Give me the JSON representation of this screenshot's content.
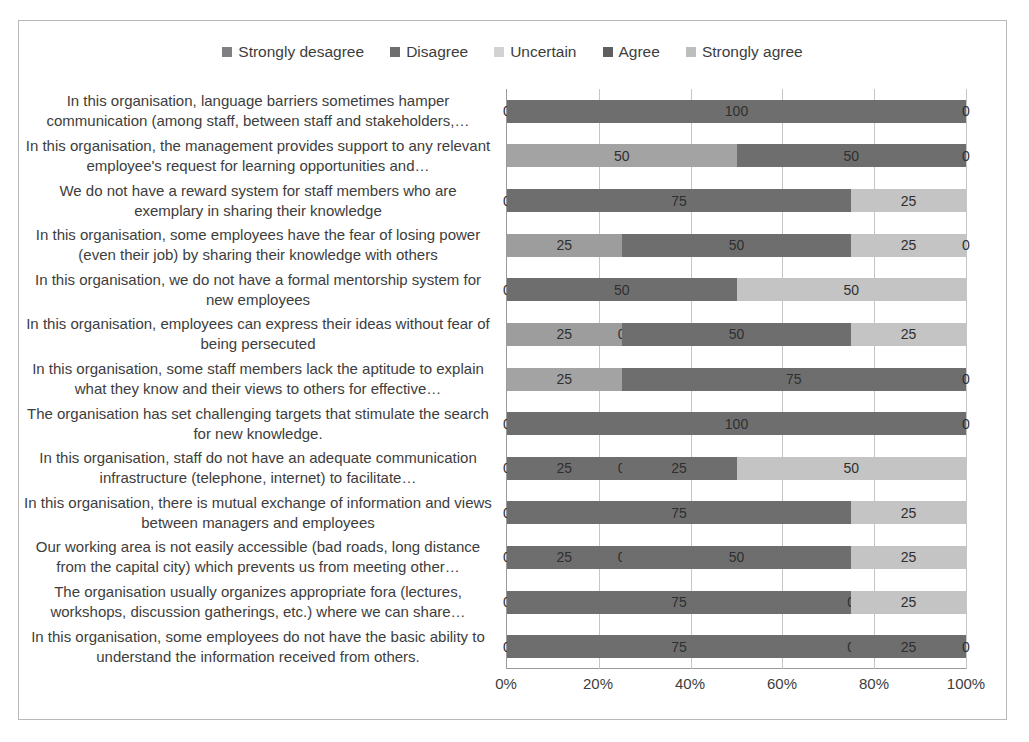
{
  "legend": {
    "position": "top-center",
    "items": [
      {
        "label": "Strongly desagree",
        "color": "#808080"
      },
      {
        "label": "Disagree",
        "color": "#6e6e6e"
      },
      {
        "label": "Uncertain",
        "color": "#d2d2d2"
      },
      {
        "label": "Agree",
        "color": "#5f5f5f"
      },
      {
        "label": "Strongly agree",
        "color": "#bdbdbd"
      }
    ]
  },
  "axis": {
    "x_ticks": [
      "0%",
      "20%",
      "40%",
      "60%",
      "80%",
      "100%"
    ],
    "x_values": [
      0,
      20,
      40,
      60,
      80,
      100
    ]
  },
  "chart_data": {
    "type": "bar",
    "orientation": "horizontal",
    "stacked": true,
    "title": "",
    "xlabel": "",
    "ylabel": "",
    "xlim": [
      0,
      100
    ],
    "grid": true,
    "legend_position": "top",
    "series": [
      {
        "name": "Strongly desagree",
        "color": "#808080",
        "values": [
          0,
          0,
          0,
          25,
          0,
          25,
          25,
          0,
          0,
          0,
          0,
          0,
          0
        ]
      },
      {
        "name": "Disagree",
        "color": "#6e6e6e",
        "values": [
          100,
          0,
          75,
          0,
          0,
          0,
          0,
          100,
          25,
          75,
          25,
          75,
          75
        ]
      },
      {
        "name": "Uncertain",
        "color": "#d2d2d2",
        "values": [
          0,
          50,
          0,
          0,
          0,
          0,
          0,
          0,
          0,
          0,
          0,
          0,
          0
        ]
      },
      {
        "name": "Agree",
        "color": "#5f5f5f",
        "values": [
          0,
          50,
          0,
          50,
          50,
          50,
          75,
          0,
          25,
          0,
          50,
          0,
          25
        ]
      },
      {
        "name": "Strongly agree",
        "color": "#bdbdbd",
        "values": [
          0,
          0,
          25,
          25,
          50,
          25,
          0,
          0,
          50,
          25,
          25,
          25,
          0
        ]
      }
    ],
    "categories": [
      "In this organisation, language barriers sometimes hamper communication (among staff, between staff and stakeholders,…",
      "In this organisation, the management provides support to any relevant employee's request for learning opportunities and…",
      "We do not have a reward system for staff members who are exemplary in sharing their knowledge",
      "In this organisation, some employees have the fear of losing power (even their job) by sharing their knowledge with others",
      "In this organisation, we do not have a formal mentorship system for new employees",
      "In this organisation, employees can express their ideas without fear of being persecuted",
      "In this organisation, some staff members lack the aptitude to explain what they know and their views to others for effective…",
      "The organisation has set challenging targets that stimulate the search for new knowledge.",
      "In this organisation, staff do not have an adequate communication infrastructure (telephone, internet) to facilitate…",
      "In this organisation, there is mutual exchange of information and views between managers and employees",
      "Our working area is not easily accessible (bad roads, long distance from the capital city) which prevents us from meeting other…",
      "The organisation usually organizes appropriate fora (lectures, workshops, discussion gatherings, etc.) where we can share…",
      "In this organisation, some employees do not have the basic ability to understand the information received from others."
    ],
    "rows": [
      {
        "segments": [
          {
            "series": "Strongly desagree",
            "value": 0,
            "label": "0",
            "color": "#808080"
          },
          {
            "series": "Disagree",
            "value": 100,
            "label": "100",
            "color": "#6e6e6e"
          },
          {
            "series": "Strongly agree",
            "value": 0,
            "label": "0",
            "color": "#bdbdbd"
          }
        ]
      },
      {
        "segments": [
          {
            "series": "Uncertain",
            "value": 50,
            "label": "50",
            "color": "#a3a3a3"
          },
          {
            "series": "Agree",
            "value": 50,
            "label": "50",
            "color": "#6e6e6e"
          },
          {
            "series": "Strongly agree",
            "value": 0,
            "label": "0",
            "color": "#bdbdbd"
          }
        ]
      },
      {
        "segments": [
          {
            "series": "Strongly desagree",
            "value": 0,
            "label": "0",
            "color": "#808080"
          },
          {
            "series": "Disagree",
            "value": 75,
            "label": "75",
            "color": "#6e6e6e"
          },
          {
            "series": "Strongly agree",
            "value": 25,
            "label": "25",
            "color": "#c4c4c4"
          }
        ]
      },
      {
        "segments": [
          {
            "series": "Strongly desagree",
            "value": 25,
            "label": "25",
            "color": "#9d9d9d"
          },
          {
            "series": "Agree",
            "value": 50,
            "label": "50",
            "color": "#6e6e6e"
          },
          {
            "series": "Strongly agree",
            "value": 25,
            "label": "25",
            "color": "#c4c4c4"
          },
          {
            "series": "Strongly agree",
            "value": 0,
            "label": "0",
            "color": "#c4c4c4"
          }
        ]
      },
      {
        "segments": [
          {
            "series": "Strongly desagree",
            "value": 0,
            "label": "0",
            "color": "#808080"
          },
          {
            "series": "Disagree",
            "value": 50,
            "label": "50",
            "color": "#6e6e6e"
          },
          {
            "series": "Strongly agree",
            "value": 50,
            "label": "50",
            "color": "#c4c4c4"
          }
        ]
      },
      {
        "segments": [
          {
            "series": "Strongly desagree",
            "value": 25,
            "label": "25",
            "color": "#9d9d9d"
          },
          {
            "series": "Disagree",
            "value": 0,
            "label": "0",
            "color": "#6e6e6e"
          },
          {
            "series": "Agree",
            "value": 50,
            "label": "50",
            "color": "#6e6e6e"
          },
          {
            "series": "Strongly agree",
            "value": 25,
            "label": "25",
            "color": "#c4c4c4"
          }
        ]
      },
      {
        "segments": [
          {
            "series": "Strongly desagree",
            "value": 25,
            "label": "25",
            "color": "#a3a3a3"
          },
          {
            "series": "Agree",
            "value": 75,
            "label": "75",
            "color": "#6e6e6e"
          },
          {
            "series": "Strongly agree",
            "value": 0,
            "label": "0",
            "color": "#bdbdbd"
          }
        ]
      },
      {
        "segments": [
          {
            "series": "Strongly desagree",
            "value": 0,
            "label": "0",
            "color": "#808080"
          },
          {
            "series": "Disagree",
            "value": 100,
            "label": "100",
            "color": "#6e6e6e"
          },
          {
            "series": "Strongly agree",
            "value": 0,
            "label": "0",
            "color": "#bdbdbd"
          }
        ]
      },
      {
        "segments": [
          {
            "series": "Strongly desagree",
            "value": 0,
            "label": "0",
            "color": "#808080"
          },
          {
            "series": "Disagree",
            "value": 25,
            "label": "25",
            "color": "#6e6e6e"
          },
          {
            "series": "Uncertain",
            "value": 0,
            "label": "0",
            "color": "#6e6e6e"
          },
          {
            "series": "Agree",
            "value": 25,
            "label": "25",
            "color": "#6e6e6e"
          },
          {
            "series": "Strongly agree",
            "value": 50,
            "label": "50",
            "color": "#c4c4c4"
          }
        ]
      },
      {
        "segments": [
          {
            "series": "Strongly desagree",
            "value": 0,
            "label": "0",
            "color": "#808080"
          },
          {
            "series": "Disagree",
            "value": 75,
            "label": "75",
            "color": "#6e6e6e"
          },
          {
            "series": "Strongly agree",
            "value": 25,
            "label": "25",
            "color": "#c4c4c4"
          }
        ]
      },
      {
        "segments": [
          {
            "series": "Strongly desagree",
            "value": 0,
            "label": "0",
            "color": "#808080"
          },
          {
            "series": "Disagree",
            "value": 25,
            "label": "25",
            "color": "#6e6e6e"
          },
          {
            "series": "Uncertain",
            "value": 0,
            "label": "0",
            "color": "#6e6e6e"
          },
          {
            "series": "Agree",
            "value": 50,
            "label": "50",
            "color": "#6e6e6e"
          },
          {
            "series": "Strongly agree",
            "value": 25,
            "label": "25",
            "color": "#c4c4c4"
          }
        ]
      },
      {
        "segments": [
          {
            "series": "Strongly desagree",
            "value": 0,
            "label": "0",
            "color": "#808080"
          },
          {
            "series": "Disagree",
            "value": 75,
            "label": "75",
            "color": "#6e6e6e"
          },
          {
            "series": "Uncertain",
            "value": 0,
            "label": "0",
            "color": "#6e6e6e"
          },
          {
            "series": "Strongly agree",
            "value": 25,
            "label": "25",
            "color": "#c4c4c4"
          }
        ]
      },
      {
        "segments": [
          {
            "series": "Strongly desagree",
            "value": 0,
            "label": "0",
            "color": "#808080"
          },
          {
            "series": "Disagree",
            "value": 75,
            "label": "75",
            "color": "#6e6e6e"
          },
          {
            "series": "Uncertain",
            "value": 0,
            "label": "0",
            "color": "#6e6e6e"
          },
          {
            "series": "Agree",
            "value": 25,
            "label": "25",
            "color": "#6e6e6e"
          },
          {
            "series": "Strongly agree",
            "value": 0,
            "label": "0",
            "color": "#bdbdbd"
          }
        ]
      }
    ]
  }
}
